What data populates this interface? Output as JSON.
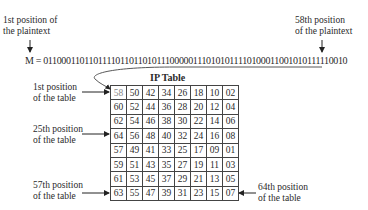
{
  "labels": {
    "first_plain_1": "1st position of",
    "first_plain_2": "the plaintext",
    "plain58_1": "58th position",
    "plain58_2": "of the plaintext",
    "t1_1": "1st position",
    "t1_2": "of the table",
    "t25_1": "25th position",
    "t25_2": "of the table",
    "t57_1": "57th position",
    "t57_2": "of the table",
    "t64_1": "64th position",
    "t64_2": "of the table"
  },
  "message": "M = 0110001101101111011011010111000001110101011110100011001010111110010",
  "table_title": "IP Table",
  "ip_table": [
    [
      "58",
      "50",
      "42",
      "34",
      "26",
      "18",
      "10",
      "02"
    ],
    [
      "60",
      "52",
      "44",
      "36",
      "28",
      "20",
      "12",
      "04"
    ],
    [
      "62",
      "54",
      "46",
      "38",
      "30",
      "22",
      "14",
      "06"
    ],
    [
      "64",
      "56",
      "48",
      "40",
      "32",
      "24",
      "16",
      "08"
    ],
    [
      "57",
      "49",
      "41",
      "33",
      "25",
      "17",
      "09",
      "01"
    ],
    [
      "59",
      "51",
      "43",
      "35",
      "27",
      "19",
      "11",
      "03"
    ],
    [
      "61",
      "53",
      "45",
      "37",
      "29",
      "21",
      "13",
      "05"
    ],
    [
      "63",
      "55",
      "47",
      "39",
      "31",
      "23",
      "15",
      "07"
    ]
  ]
}
